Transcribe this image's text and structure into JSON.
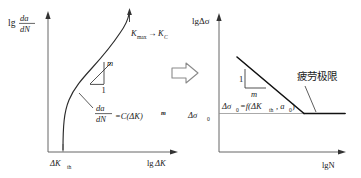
{
  "figure": {
    "title": "",
    "type": "diagram",
    "background_color": "#ffffff",
    "ink_color": "#1a1a1a",
    "transition_arrow": {
      "name": "implies-arrow",
      "glyph": "hollow-right-arrow"
    }
  },
  "left_chart": {
    "name": "crack-growth-rate-curve",
    "type": "line",
    "axis": {
      "y_label": "lg",
      "y_label_fraction_num": "da",
      "y_label_fraction_den": "dN",
      "x_label_prefix": "lg",
      "x_label_suffix": "ΔK",
      "x_tick_label": "ΔK",
      "x_tick_sub": "th"
    },
    "annotations": {
      "top_right": "K",
      "top_right_sub": "max",
      "top_right_arrow": "→",
      "top_right_target": "K",
      "top_right_target_sub": "C",
      "slope_rise": "m",
      "slope_run": "1",
      "equation_num": "da",
      "equation_den": "dN",
      "equation_rhs": "=C(ΔK)",
      "equation_exp": "m"
    }
  },
  "right_chart": {
    "name": "stress-range-vs-life-curve",
    "type": "line",
    "axis": {
      "y_label": "lgΔσ",
      "x_label": "lgN",
      "y_tick_label": "Δσ",
      "y_tick_sub": "0"
    },
    "annotations": {
      "slope_rise": "1",
      "slope_run": "m",
      "formula_lhs": "Δσ",
      "formula_lhs_sub": "0",
      "formula_rhs": "=f(ΔK",
      "formula_rhs_sub": "th",
      "formula_rhs_mid": ",  a",
      "formula_rhs_sub2": "0",
      "formula_rhs_end": ")",
      "callout_label": "疲劳极限"
    }
  }
}
